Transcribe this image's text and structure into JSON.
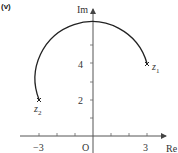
{
  "figure": {
    "part_label": "(v)",
    "x_axis_label": "Re",
    "y_axis_label": "Im",
    "origin_label": "O",
    "x_tick_labels": [
      {
        "value": -3,
        "text": "−3"
      },
      {
        "value": 3,
        "text": "3"
      }
    ],
    "y_tick_labels": [
      {
        "value": 2,
        "text": "2"
      },
      {
        "value": 4,
        "text": "4"
      }
    ],
    "points": [
      {
        "name": "z1",
        "label": "z",
        "subscript": "1",
        "re": 3,
        "im": 4
      },
      {
        "name": "z2",
        "label": "z",
        "subscript": "2",
        "re": -3,
        "im": 2
      }
    ],
    "arc": {
      "center_re": 0,
      "center_im": 3,
      "radius": "√10",
      "from": "z1",
      "to": "z2",
      "direction": "anticlockwise"
    },
    "colors": {
      "axis": "#555555",
      "curve": "#222222",
      "text": "#333333"
    }
  }
}
